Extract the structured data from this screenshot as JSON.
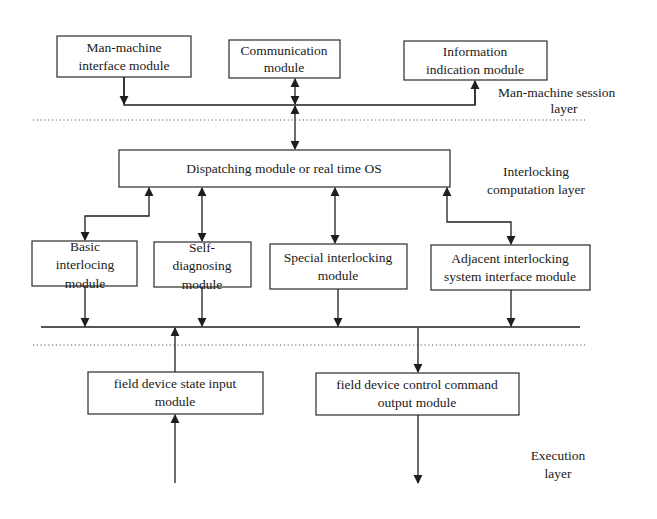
{
  "diagram": {
    "layers": {
      "session": [
        "Man-machine session",
        "layer"
      ],
      "computation": [
        "Interlocking",
        "computation layer"
      ],
      "execution": [
        "Execution",
        "layer"
      ]
    },
    "modules": {
      "man_machine": [
        "Man-machine",
        "interface module"
      ],
      "communication": [
        "Communication",
        "module"
      ],
      "information": [
        "Information",
        "indication module"
      ],
      "dispatching": [
        "Dispatching module or real time OS"
      ],
      "basic": [
        "Basic",
        "interlocing",
        "module"
      ],
      "self_diag": [
        "Self-",
        "diagnosing",
        "module"
      ],
      "special": [
        "Special interlocking",
        "module"
      ],
      "adjacent": [
        "Adjacent interlocking",
        "system interface module"
      ],
      "state_input": [
        "field device state input",
        "module"
      ],
      "control_output": [
        "field device control command",
        "output module"
      ],
      "field_device": [
        "field device"
      ]
    },
    "colors": {
      "stroke": "#1e1e1e",
      "background": "#ffffff"
    }
  }
}
